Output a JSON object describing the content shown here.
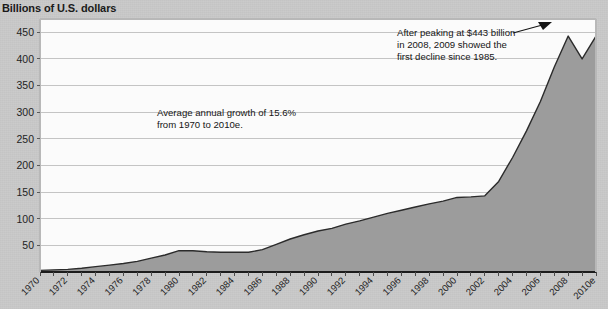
{
  "chart_title": "Billions of U.S. dollars",
  "annotations": {
    "growth": {
      "line1": "Average annual growth of 15.6%",
      "line2": "from 1970 to 2010e."
    },
    "peak": {
      "line1": "After peaking at $443 billion",
      "line2": "in 2008, 2009 showed the",
      "line3": "first decline since 1985."
    }
  },
  "colors": {
    "area_fill": "#9c9c9c",
    "plot_background": "#fbfbfb",
    "line": "#2b2b2b",
    "gridline": "#c4c4c4",
    "axis": "#1c1c1c",
    "page_background": "#c9c9c9"
  },
  "chart_data": {
    "type": "area",
    "title": "Billions of U.S. dollars",
    "xlabel": "",
    "ylabel": "Billions of U.S. dollars",
    "ylim": [
      0,
      475
    ],
    "xlim": [
      1970,
      2010
    ],
    "grid": true,
    "legend": "none",
    "ytick_labels": [
      "50",
      "100",
      "150",
      "200",
      "250",
      "300",
      "350",
      "400",
      "450"
    ],
    "yticks": [
      50,
      100,
      150,
      200,
      250,
      300,
      350,
      400,
      450
    ],
    "xtick_labels": [
      "1970",
      "1972",
      "1974",
      "1976",
      "1978",
      "1980",
      "1982",
      "1984",
      "1986",
      "1988",
      "1990",
      "1992",
      "1994",
      "1996",
      "1998",
      "2000",
      "2002",
      "2004",
      "2006",
      "2008",
      "2010e"
    ],
    "x": [
      1970,
      1971,
      1972,
      1973,
      1974,
      1975,
      1976,
      1977,
      1978,
      1979,
      1980,
      1981,
      1982,
      1983,
      1984,
      1985,
      1986,
      1987,
      1988,
      1989,
      1990,
      1991,
      1992,
      1993,
      1994,
      1995,
      1996,
      1997,
      1998,
      1999,
      2000,
      2001,
      2002,
      2003,
      2004,
      2005,
      2006,
      2007,
      2008,
      2009,
      2010
    ],
    "values": [
      3,
      4,
      5,
      7,
      10,
      13,
      16,
      20,
      26,
      32,
      40,
      40,
      38,
      37,
      37,
      37,
      42,
      52,
      62,
      70,
      77,
      82,
      90,
      96,
      103,
      110,
      116,
      122,
      128,
      133,
      140,
      141,
      143,
      170,
      215,
      265,
      320,
      385,
      443,
      400,
      443
    ],
    "annotations": [
      {
        "text": "Average annual growth of 15.6% from 1970 to 2010e.",
        "x": 1981,
        "y": 270
      },
      {
        "text": "After peaking at $443 billion in 2008, 2009 showed the first decline since 1985.",
        "x": 2002,
        "y": 440,
        "arrow_target_x": 2008,
        "arrow_target_y": 443
      }
    ]
  }
}
